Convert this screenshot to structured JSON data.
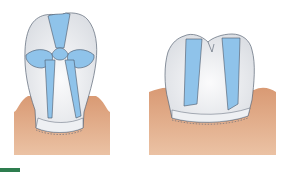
{
  "figure": {
    "type": "dental-illustration",
    "panels": [
      {
        "name": "anterior-tooth-crown",
        "description": "Incisor/canine crown seen facially with blue reduction zones"
      },
      {
        "name": "posterior-tooth-crown",
        "description": "Molar crown seen facially with blue reduction zones"
      }
    ]
  },
  "colors": {
    "enamel": "#e6e8ec",
    "enamel_highlight": "#f7f8fa",
    "zone_blue": "#8fc3ea",
    "outline": "#4a5566",
    "gingiva": "#dca07c",
    "gingiva_light": "#e8b898",
    "accent_green": "#2e7d4f"
  }
}
